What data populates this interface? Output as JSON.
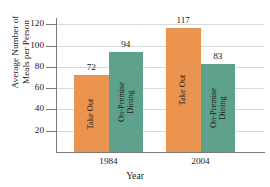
{
  "chart_data": {
    "type": "bar",
    "title": "",
    "xlabel": "Year",
    "ylabel_line1": "Average Number of",
    "ylabel_line2": "Meals per Person",
    "categories": [
      "1984",
      "2004"
    ],
    "series": [
      {
        "name": "Take Out",
        "name_line1": "Take Out",
        "name_line2": "",
        "color": "#EB9450",
        "values": [
          72,
          117
        ]
      },
      {
        "name": "On-Premise Dining",
        "name_line1": "On-Premise",
        "name_line2": "Dining",
        "color": "#5EA18D",
        "values": [
          94,
          83
        ]
      }
    ],
    "ylim": [
      0,
      126
    ],
    "yticks": [
      20,
      40,
      60,
      80,
      100,
      120
    ],
    "ytick_labels": [
      "20",
      "40",
      "60",
      "80",
      "100",
      "120"
    ],
    "value_labels": [
      "72",
      "94",
      "117",
      "83"
    ],
    "grid": true,
    "legend": "none",
    "axis_color": "#7a7a7a",
    "grid_color": "#d9d9d9",
    "text_color": "#1a1a1a",
    "background": "#ffffff"
  }
}
